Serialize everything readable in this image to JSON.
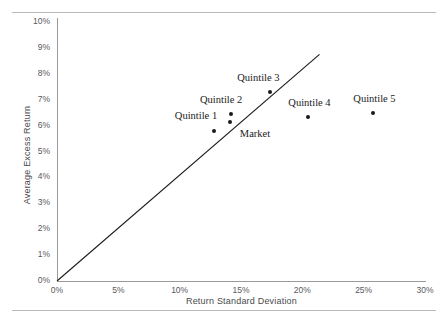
{
  "page": {
    "clipped_header_text": "",
    "rules": [
      "top-rule",
      "bottom-rule"
    ]
  },
  "chart_data": {
    "type": "scatter",
    "title": "",
    "xlabel": "Return Standard Deviation",
    "ylabel": "Average Excess Return",
    "xlim": [
      0,
      30
    ],
    "ylim": [
      0,
      10
    ],
    "x_ticks": [
      "0%",
      "5%",
      "10%",
      "15%",
      "20%",
      "25%",
      "30%"
    ],
    "x_tick_values": [
      0,
      5,
      10,
      15,
      20,
      25,
      30
    ],
    "y_ticks": [
      "0%",
      "1%",
      "2%",
      "3%",
      "4%",
      "5%",
      "6%",
      "7%",
      "8%",
      "9%",
      "10%"
    ],
    "y_tick_values": [
      0,
      1,
      2,
      3,
      4,
      5,
      6,
      7,
      8,
      9,
      10
    ],
    "grid": false,
    "legend": "none",
    "series": [
      {
        "name": "Portfolios",
        "points": [
          {
            "label": "Quintile 1",
            "x": 12.8,
            "y": 5.8,
            "label_dx": -18,
            "label_dy": -15
          },
          {
            "label": "Quintile 2",
            "x": 14.2,
            "y": 6.45,
            "label_dx": -10,
            "label_dy": -14
          },
          {
            "label": "Market",
            "x": 14.1,
            "y": 6.15,
            "label_dx": 25,
            "label_dy": 12
          },
          {
            "label": "Quintile 3",
            "x": 17.4,
            "y": 7.3,
            "label_dx": -12,
            "label_dy": -14
          },
          {
            "label": "Quintile 4",
            "x": 20.5,
            "y": 6.35,
            "label_dx": 1,
            "label_dy": -14
          },
          {
            "label": "Quintile 5",
            "x": 25.8,
            "y": 6.5,
            "label_dx": 1,
            "label_dy": -14
          }
        ]
      }
    ],
    "reference_line": {
      "name": "security-market-line",
      "from": [
        0,
        0
      ],
      "to": [
        21.4,
        8.75
      ],
      "color": "#1a1a1a"
    },
    "colors": {
      "marker": "#1a1a1a",
      "axis": "#9a9a9a",
      "tick_text": "#59595b",
      "axis_title": "#4a4a4c",
      "rule": "#b9b9b9"
    }
  }
}
